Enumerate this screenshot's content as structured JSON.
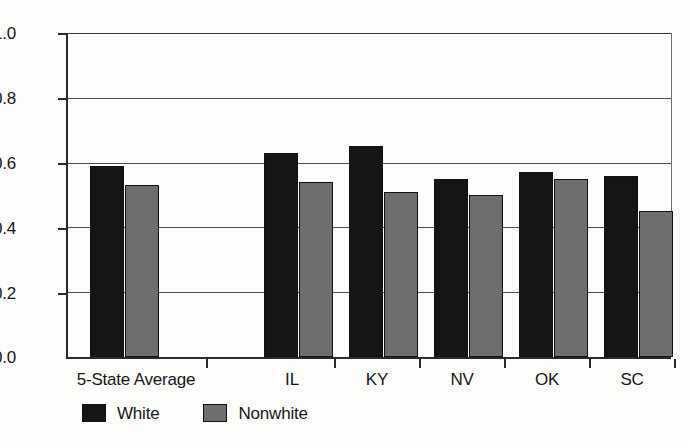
{
  "chart_data": {
    "type": "bar",
    "title": "",
    "subtitle": "",
    "xlabel": "",
    "ylabel": "",
    "categories": [
      "5-State Average",
      "IL",
      "KY",
      "NV",
      "OK",
      "SC"
    ],
    "series": [
      {
        "name": "White",
        "color": "#151515",
        "values": [
          0.59,
          0.63,
          0.65,
          0.55,
          0.57,
          0.56
        ]
      },
      {
        "name": "Nonwhite",
        "color": "#6e6e6e",
        "values": [
          0.53,
          0.54,
          0.51,
          0.5,
          0.55,
          0.45
        ]
      }
    ],
    "ylim": [
      0.0,
      1.0
    ],
    "y_ticks": [
      0.0,
      0.2,
      0.4,
      0.6,
      0.8,
      1.0
    ],
    "y_tick_labels": [
      "0.0",
      "0.2",
      "0.4",
      "0.6",
      "0.8",
      "1.0"
    ],
    "grid": "horizontal",
    "legend_position": "bottom-left",
    "legend": [
      "White",
      "Nonwhite"
    ]
  }
}
